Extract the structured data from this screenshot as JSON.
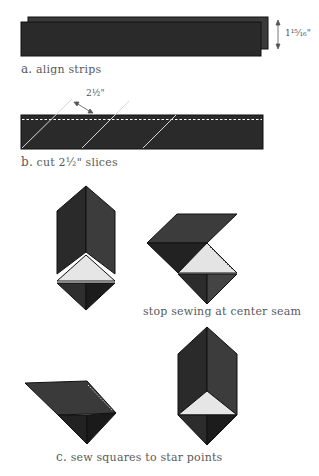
{
  "steps": {
    "a": {
      "letter": "a.",
      "caption": "align strips",
      "dimension": "1¹⁵⁄₁₆\""
    },
    "b": {
      "letter": "b.",
      "caption": "cut 2½\" slices",
      "dimension": "2½\""
    },
    "c": {
      "letter": "c.",
      "caption": "sew squares to star points",
      "note": "stop sewing at center seam"
    }
  },
  "colors": {
    "dark_fabric": "#2a2a2a",
    "darker_fabric": "#1c1c1c",
    "mid_fabric": "#3e3e3e",
    "light_fabric": "#e4e4e4",
    "stitch_line": "#ffffff",
    "cut_line": "#d8d8d8"
  }
}
